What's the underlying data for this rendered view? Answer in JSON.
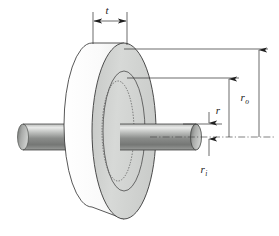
{
  "figure": {
    "kind": "engineering-diagram",
    "background_color": "#ffffff",
    "line_color": "#2b2b2b"
  },
  "labels": {
    "thickness": {
      "symbol": "t",
      "subscript": "",
      "meaning": "disk thickness"
    },
    "outer_radius": {
      "symbol": "r",
      "subscript": "o",
      "meaning": "outer radius of disk"
    },
    "generic_radius": {
      "symbol": "r",
      "subscript": "",
      "meaning": "arbitrary radius"
    },
    "inner_radius": {
      "symbol": "r",
      "subscript": "i",
      "meaning": "inner radius / shaft radius"
    }
  },
  "geometry": {
    "disk": {
      "front_face_fill": "#d2d4d2",
      "back_face_fill": "#fbfbfb",
      "front_face_center_x": 124,
      "front_face_center_y": 131,
      "front_face_rx": 32,
      "front_face_ry": 88,
      "back_face_center_x": 92,
      "back_face_center_y": 125,
      "back_face_rx": 28,
      "back_face_ry": 82,
      "hub_ring_rx": 21,
      "hub_ring_ry": 60,
      "bore_hidden_rx": 17,
      "bore_hidden_ry": 50
    },
    "shaft": {
      "fill_light": "#e8e8e8",
      "fill_mid": "#8d8f8d",
      "fill_dark": "#6e706e",
      "axis_y": 137,
      "half_height": 13,
      "left_end_x": 18,
      "right_end_x": 196,
      "cap_rx": 5
    },
    "centerline_y": 137,
    "dimension_lines": {
      "t_y": 18,
      "t_left_x": 97,
      "t_right_x": 127,
      "ro_x": 259,
      "ro_top_y": 49,
      "r_x": 229,
      "r_top_y": 78,
      "ri_x": 209,
      "ri_bottom_y": 124
    }
  }
}
